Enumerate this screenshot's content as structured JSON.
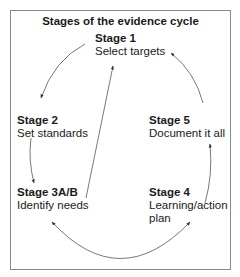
{
  "title": "Stages of the evidence cycle",
  "stages": {
    "s1": {
      "name": "Stage 1",
      "desc": "Select targets"
    },
    "s2": {
      "name": "Stage 2",
      "desc": "Set standards"
    },
    "s3": {
      "name": "Stage 3A/B",
      "desc": "Identify needs"
    },
    "s4": {
      "name": "Stage 4",
      "desc_line1": "Learning/action",
      "desc_line2": "plan"
    },
    "s5": {
      "name": "Stage 5",
      "desc": "Document it all"
    }
  },
  "connections": [
    {
      "from": "Stage 1",
      "to": "Stage 2",
      "type": "curved-arrow"
    },
    {
      "from": "Stage 2",
      "to": "Stage 3A/B",
      "type": "curved-arrow"
    },
    {
      "from": "Stage 3A/B",
      "to": "Stage 1",
      "type": "straight-arrow"
    },
    {
      "from": "Stage 3A/B",
      "to": "Stage 4",
      "type": "double-headed-arc"
    },
    {
      "from": "Stage 4",
      "to": "Stage 5",
      "type": "curved-arrow"
    },
    {
      "from": "Stage 5",
      "to": "Stage 1",
      "type": "curved-arrow"
    }
  ],
  "colors": {
    "border": "#8a8a8a",
    "text": "#1a1a1a",
    "arrow": "#333333"
  }
}
